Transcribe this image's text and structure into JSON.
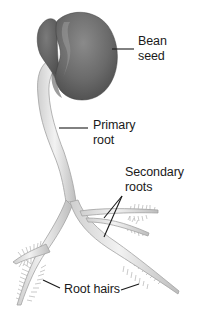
{
  "diagram": {
    "labels": {
      "bean_seed": {
        "line1": "Bean",
        "line2": "seed"
      },
      "primary_root": {
        "line1": "Primary",
        "line2": "root"
      },
      "secondary_roots": {
        "line1": "Secondary",
        "line2": "roots"
      },
      "root_hairs": {
        "line1": "Root hairs"
      }
    },
    "colors": {
      "seed": "#6e6e6e",
      "seed_dark": "#4a4a4a",
      "root": "#e4e4e4",
      "root_edge": "#a8a8a8",
      "hair": "#9a9a9a",
      "leader_line": "#1a1a1a",
      "text": "#1a1a1a"
    }
  }
}
